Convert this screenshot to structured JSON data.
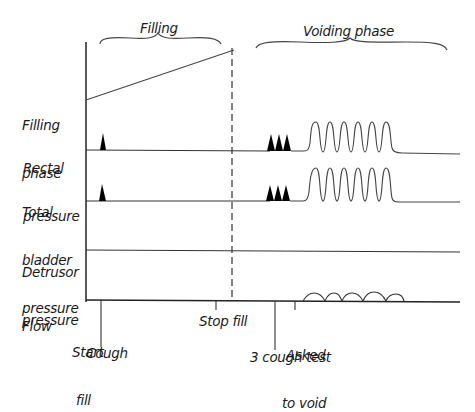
{
  "diagram": {
    "type": "urodynamic-trace-diagram",
    "phase_labels": {
      "filling": "Filling",
      "voiding": "Voiding phase"
    },
    "channels": [
      {
        "id": "filling-phase",
        "label_line1": "Filling",
        "label_line2": "phase"
      },
      {
        "id": "rectal-pressure",
        "label_line1": "Rectal",
        "label_line2": "pressure"
      },
      {
        "id": "total-bladder-pressure",
        "label_line1": "Total",
        "label_line2": "bladder",
        "label_line3": "pressure"
      },
      {
        "id": "detrusor-pressure",
        "label_line1": "Detrusor",
        "label_line2": "pressure"
      },
      {
        "id": "flow",
        "label_line1": "Flow"
      }
    ],
    "events": {
      "start_fill_line1": "Start",
      "start_fill_line2": "fill",
      "cough": "Cough",
      "stop_fill": "Stop fill",
      "three_cough_test": "3 cough test",
      "asked_to_void_line1": "Asked",
      "asked_to_void_line2": "to void"
    },
    "trace_features": {
      "rectal_single_spikes": 1,
      "rectal_cough_test_spikes": 3,
      "rectal_oscillations": 6,
      "bladder_single_spikes": 1,
      "bladder_cough_test_spikes": 3,
      "bladder_oscillations": 6,
      "flow_humps": 5
    },
    "colors": {
      "line": "#333333",
      "fill": "#000000",
      "background": "#ffffff"
    }
  }
}
